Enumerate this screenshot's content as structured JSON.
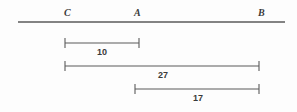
{
  "figure": {
    "type": "geometry-number-line-diagram",
    "background_color": "#fdfdfd",
    "line_color": "#5a5a5a",
    "text_color": "#3a3a3a",
    "main_line": {
      "name": "line-CB",
      "x_start": 18,
      "x_end": 285,
      "y": 22
    },
    "points": [
      {
        "label": "C",
        "x": 65,
        "label_x": 64,
        "label_y": 8
      },
      {
        "label": "A",
        "x": 135,
        "label_x": 134,
        "label_y": 8
      },
      {
        "label": "B",
        "x": 259,
        "label_x": 258,
        "label_y": 8
      }
    ],
    "measures": [
      {
        "id": "measure-10",
        "value": "10",
        "from_point": "C",
        "to_point": "A",
        "x_start": 65,
        "x_end": 139,
        "y": 43,
        "label_x": 102,
        "label_y": 48
      },
      {
        "id": "measure-27",
        "value": "27",
        "from_point": "C",
        "to_point": "B",
        "x_start": 65,
        "x_end": 259,
        "y": 66,
        "label_x": 163,
        "label_y": 71
      },
      {
        "id": "measure-17",
        "value": "17",
        "from_point": "A",
        "to_point": "B",
        "x_start": 135,
        "x_end": 259,
        "y": 89,
        "label_x": 198,
        "label_y": 94
      }
    ]
  }
}
